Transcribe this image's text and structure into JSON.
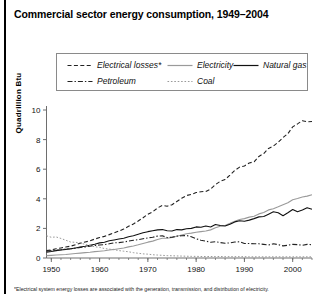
{
  "figure": {
    "title": "Commercial sector energy consumption, 1949–2004",
    "footnote": "*Electrical system energy losses are associated with the generation, transmission, and distribution of electricity."
  },
  "legend": {
    "box_border_color": "#8a8a8a",
    "rows": [
      [
        {
          "label": "Electrical losses*",
          "style": "dashed",
          "color": "#222222",
          "x": 10
        },
        {
          "label": "Electricity",
          "style": "solid",
          "color": "#9a9a9a",
          "x": 110
        },
        {
          "label": "Natural gas",
          "style": "solid",
          "color": "#111111",
          "x": 176
        }
      ],
      [
        {
          "label": "Petroleum",
          "style": "dashdot",
          "color": "#222222",
          "x": 10
        },
        {
          "label": "Coal",
          "style": "dotted",
          "color": "#9a9a9a",
          "x": 110
        }
      ]
    ]
  },
  "axes": {
    "ylabel": "Quadrillion Btu",
    "yticks": [
      0,
      2,
      4,
      6,
      8,
      10
    ],
    "ylim": [
      0,
      10
    ],
    "xticks": [
      1950,
      1960,
      1970,
      1980,
      1990,
      2000
    ],
    "xlim": [
      1949,
      2004
    ],
    "grid": false,
    "axis_color": "#6e6e6e"
  },
  "chart_data": {
    "type": "line",
    "title": "Commercial sector energy consumption, 1949–2004",
    "xlabel": "",
    "ylabel": "Quadrillion Btu",
    "xlim": [
      1949,
      2004
    ],
    "ylim": [
      0,
      10
    ],
    "grid": false,
    "legend_position": "top",
    "annotations": [
      "*Electrical system energy losses are associated with the generation, transmission, and distribution of electricity."
    ],
    "x": [
      1949,
      1950,
      1951,
      1952,
      1953,
      1954,
      1955,
      1956,
      1957,
      1958,
      1959,
      1960,
      1961,
      1962,
      1963,
      1964,
      1965,
      1966,
      1967,
      1968,
      1969,
      1970,
      1971,
      1972,
      1973,
      1974,
      1975,
      1976,
      1977,
      1978,
      1979,
      1980,
      1981,
      1982,
      1983,
      1984,
      1985,
      1986,
      1987,
      1988,
      1989,
      1990,
      1991,
      1992,
      1993,
      1994,
      1995,
      1996,
      1997,
      1998,
      1999,
      2000,
      2001,
      2002,
      2003,
      2004
    ],
    "series": [
      {
        "name": "Electrical losses*",
        "style": "dashed",
        "color": "#222222",
        "values": [
          0.5,
          0.55,
          0.62,
          0.68,
          0.74,
          0.8,
          0.9,
          1.0,
          1.08,
          1.16,
          1.28,
          1.38,
          1.46,
          1.58,
          1.7,
          1.82,
          1.96,
          2.14,
          2.3,
          2.5,
          2.72,
          2.96,
          3.12,
          3.38,
          3.56,
          3.5,
          3.6,
          3.82,
          4.04,
          4.22,
          4.3,
          4.42,
          4.48,
          4.5,
          4.66,
          4.96,
          5.18,
          5.3,
          5.6,
          5.92,
          6.14,
          6.22,
          6.42,
          6.5,
          6.86,
          7.06,
          7.4,
          7.56,
          7.82,
          8.14,
          8.4,
          8.86,
          9.06,
          9.28,
          9.2,
          9.22
        ]
      },
      {
        "name": "Electricity",
        "style": "solid",
        "color": "#9a9a9a",
        "values": [
          0.16,
          0.18,
          0.2,
          0.22,
          0.24,
          0.27,
          0.3,
          0.33,
          0.36,
          0.39,
          0.43,
          0.46,
          0.49,
          0.54,
          0.58,
          0.63,
          0.68,
          0.75,
          0.81,
          0.89,
          0.98,
          1.07,
          1.14,
          1.25,
          1.33,
          1.33,
          1.38,
          1.47,
          1.56,
          1.64,
          1.68,
          1.74,
          1.78,
          1.82,
          1.9,
          2.04,
          2.14,
          2.2,
          2.34,
          2.49,
          2.6,
          2.66,
          2.76,
          2.82,
          2.98,
          3.08,
          3.25,
          3.33,
          3.46,
          3.6,
          3.73,
          3.94,
          4.02,
          4.12,
          4.18,
          4.28
        ]
      },
      {
        "name": "Natural gas",
        "style": "solid",
        "color": "#111111",
        "values": [
          0.39,
          0.44,
          0.5,
          0.54,
          0.58,
          0.62,
          0.68,
          0.74,
          0.79,
          0.86,
          0.93,
          1.02,
          1.06,
          1.16,
          1.22,
          1.28,
          1.34,
          1.44,
          1.5,
          1.6,
          1.7,
          1.78,
          1.84,
          1.9,
          1.92,
          1.84,
          1.82,
          1.92,
          1.9,
          1.98,
          2.0,
          2.1,
          2.08,
          2.16,
          2.1,
          2.26,
          2.2,
          2.16,
          2.28,
          2.44,
          2.52,
          2.48,
          2.56,
          2.66,
          2.78,
          2.8,
          2.96,
          3.12,
          3.06,
          2.86,
          3.06,
          3.28,
          3.12,
          3.24,
          3.4,
          3.3
        ]
      },
      {
        "name": "Petroleum",
        "style": "dashdot",
        "color": "#222222",
        "values": [
          0.46,
          0.5,
          0.54,
          0.56,
          0.6,
          0.62,
          0.66,
          0.72,
          0.74,
          0.8,
          0.84,
          0.88,
          0.9,
          0.96,
          1.02,
          1.04,
          1.08,
          1.14,
          1.2,
          1.24,
          1.3,
          1.36,
          1.4,
          1.48,
          1.5,
          1.38,
          1.4,
          1.48,
          1.5,
          1.52,
          1.44,
          1.3,
          1.2,
          1.14,
          1.06,
          1.1,
          1.04,
          1.0,
          1.02,
          1.08,
          1.1,
          0.98,
          0.98,
          0.96,
          0.96,
          0.92,
          0.88,
          0.96,
          0.9,
          0.82,
          0.86,
          0.92,
          0.9,
          0.86,
          0.92,
          0.9
        ]
      },
      {
        "name": "Coal",
        "style": "dotted",
        "color": "#9a9a9a",
        "values": [
          1.5,
          1.4,
          1.42,
          1.32,
          1.2,
          1.08,
          1.06,
          1.02,
          0.92,
          0.84,
          0.76,
          0.72,
          0.64,
          0.6,
          0.56,
          0.5,
          0.46,
          0.42,
          0.36,
          0.32,
          0.28,
          0.26,
          0.22,
          0.2,
          0.18,
          0.16,
          0.15,
          0.14,
          0.13,
          0.12,
          0.11,
          0.11,
          0.1,
          0.1,
          0.1,
          0.1,
          0.1,
          0.09,
          0.09,
          0.09,
          0.09,
          0.09,
          0.08,
          0.08,
          0.08,
          0.08,
          0.08,
          0.08,
          0.08,
          0.08,
          0.08,
          0.08,
          0.08,
          0.08,
          0.08,
          0.08
        ]
      }
    ]
  }
}
